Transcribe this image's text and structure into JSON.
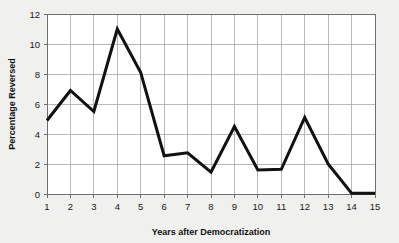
{
  "chart_data": {
    "type": "line",
    "title": "",
    "subtitle": "",
    "xlabel": "Years after Democratization",
    "ylabel": "Percentage Reversed",
    "x": [
      1,
      2,
      3,
      4,
      5,
      6,
      7,
      8,
      9,
      10,
      11,
      12,
      13,
      14,
      15
    ],
    "values": [
      4.9,
      6.9,
      5.5,
      11.0,
      8.1,
      2.55,
      2.75,
      1.45,
      4.5,
      1.6,
      1.65,
      5.1,
      2.0,
      0.05,
      0.05
    ],
    "series": [
      {
        "name": "Percentage Reversed",
        "values": [
          4.9,
          6.9,
          5.5,
          11.0,
          8.1,
          2.55,
          2.75,
          1.45,
          4.5,
          1.6,
          1.65,
          5.1,
          2.0,
          0.05,
          0.05
        ]
      }
    ],
    "xlim": [
      1,
      15
    ],
    "ylim": [
      0,
      12
    ],
    "xticks": [
      "1",
      "2",
      "3",
      "4",
      "5",
      "6",
      "7",
      "8",
      "9",
      "10",
      "11",
      "12",
      "13",
      "14",
      "15"
    ],
    "yticks": [
      "0",
      "2",
      "4",
      "6",
      "8",
      "10",
      "12"
    ],
    "ytick_values": [
      0,
      2,
      4,
      6,
      8,
      10,
      12
    ],
    "grid": true,
    "grid_axes": "both",
    "legend": false,
    "legend_position": "none",
    "line_color": "#111111",
    "grid_color": "#a8a8a8",
    "plot_background": "#ffffff",
    "figure_background": "#f0f0ee"
  }
}
